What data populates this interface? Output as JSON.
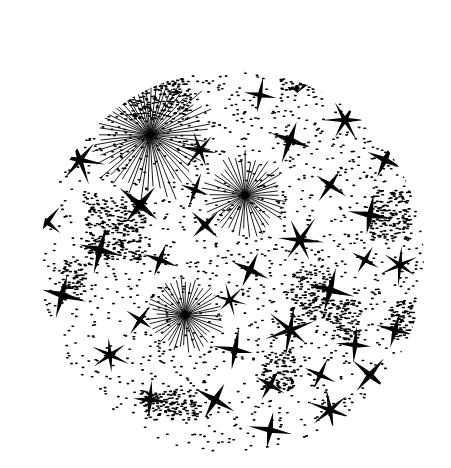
{
  "artwork": {
    "description": "Circular black-and-white ink drawing of scattered four- and six-pointed stars, stippled dot fields and radiating line bursts",
    "colors": {
      "ink": "#000000",
      "paper": "#ffffff"
    },
    "circle": {
      "cx": 232,
      "cy": 262,
      "r": 192
    },
    "bursts": [
      {
        "cx": 150,
        "cy": 135,
        "r": 70,
        "rays": 60
      },
      {
        "cx": 245,
        "cy": 195,
        "r": 45,
        "rays": 44
      },
      {
        "cx": 185,
        "cy": 315,
        "r": 40,
        "rays": 44
      }
    ],
    "stars": [
      [
        62,
        295,
        22,
        4,
        15
      ],
      [
        47,
        222,
        18,
        4,
        40
      ],
      [
        80,
        160,
        24,
        6,
        10
      ],
      [
        120,
        95,
        20,
        4,
        30
      ],
      [
        175,
        60,
        22,
        4,
        5
      ],
      [
        250,
        55,
        20,
        4,
        20
      ],
      [
        310,
        80,
        18,
        4,
        45
      ],
      [
        345,
        120,
        22,
        6,
        0
      ],
      [
        385,
        160,
        20,
        4,
        25
      ],
      [
        370,
        215,
        22,
        4,
        10
      ],
      [
        400,
        265,
        20,
        6,
        35
      ],
      [
        395,
        330,
        18,
        4,
        15
      ],
      [
        370,
        375,
        20,
        4,
        40
      ],
      [
        330,
        410,
        22,
        6,
        20
      ],
      [
        270,
        430,
        20,
        4,
        10
      ],
      [
        215,
        400,
        22,
        4,
        30
      ],
      [
        150,
        400,
        18,
        4,
        5
      ],
      [
        110,
        355,
        20,
        6,
        25
      ],
      [
        100,
        250,
        22,
        4,
        15
      ],
      [
        140,
        205,
        24,
        4,
        40
      ],
      [
        200,
        150,
        20,
        6,
        10
      ],
      [
        290,
        140,
        22,
        4,
        20
      ],
      [
        330,
        185,
        18,
        4,
        35
      ],
      [
        300,
        240,
        24,
        6,
        5
      ],
      [
        250,
        270,
        20,
        4,
        25
      ],
      [
        330,
        290,
        22,
        4,
        15
      ],
      [
        290,
        330,
        24,
        6,
        40
      ],
      [
        235,
        350,
        20,
        4,
        10
      ],
      [
        270,
        385,
        18,
        4,
        30
      ],
      [
        160,
        260,
        18,
        4,
        20
      ],
      [
        205,
        225,
        18,
        4,
        45
      ],
      [
        355,
        345,
        18,
        4,
        5
      ],
      [
        320,
        375,
        16,
        4,
        25
      ],
      [
        230,
        300,
        16,
        6,
        15
      ],
      [
        140,
        320,
        16,
        4,
        35
      ],
      [
        260,
        95,
        16,
        4,
        10
      ],
      [
        365,
        260,
        16,
        4,
        30
      ],
      [
        195,
        190,
        16,
        4,
        20
      ]
    ],
    "stipple_patches": [
      [
        120,
        80,
        70,
        40
      ],
      [
        85,
        200,
        60,
        60
      ],
      [
        280,
        50,
        50,
        40
      ],
      [
        370,
        190,
        40,
        50
      ],
      [
        290,
        270,
        40,
        50
      ],
      [
        330,
        300,
        30,
        40
      ],
      [
        140,
        390,
        60,
        30
      ],
      [
        390,
        300,
        25,
        40
      ],
      [
        260,
        350,
        35,
        40
      ],
      [
        60,
        260,
        25,
        40
      ]
    ]
  }
}
